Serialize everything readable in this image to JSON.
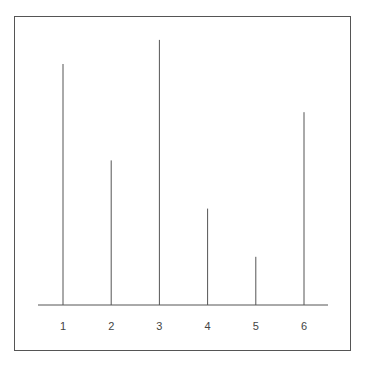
{
  "chart_data": {
    "type": "bar",
    "style": "stem",
    "title": "",
    "xlabel": "",
    "ylabel": "",
    "categories": [
      "1",
      "2",
      "3",
      "4",
      "5",
      "6"
    ],
    "values": [
      5,
      3,
      5.5,
      2,
      1,
      4
    ],
    "ylim": [
      0,
      5.5
    ],
    "grid": false,
    "legend": null,
    "colors": {
      "line": "#555555",
      "axis": "#555555",
      "frame": "#555555",
      "text": "#444444"
    }
  }
}
